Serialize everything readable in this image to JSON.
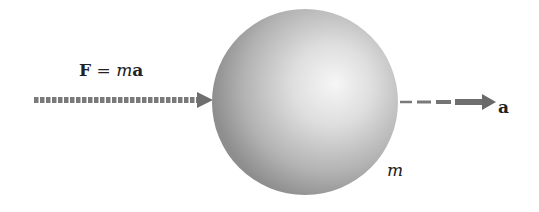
{
  "diagram": {
    "force_label": {
      "bold_part": "F",
      "equals": " = ",
      "italic_part": "m",
      "bold_tail": "a"
    },
    "acceleration_label": "a",
    "mass_label": "m",
    "colors": {
      "arrow": "#707070",
      "sphere_light": "#f4f4f4",
      "sphere_mid": "#c4c4c4",
      "sphere_dark": "#8c8c8c",
      "text": "#222222"
    }
  }
}
